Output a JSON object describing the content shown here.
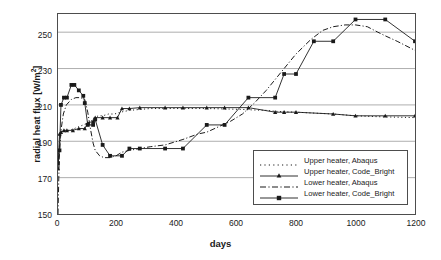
{
  "chart_data": {
    "type": "line",
    "title": "",
    "xlabel": "days",
    "ylabel": "radial heat flux [W/m²]",
    "xlim": [
      0,
      1200
    ],
    "ylim": [
      150,
      260
    ],
    "xticks": [
      0,
      200,
      400,
      600,
      800,
      1000,
      1200
    ],
    "yticks": [
      150,
      170,
      190,
      210,
      230,
      250
    ],
    "grid": "horizontal",
    "legend_position": "inside lower right",
    "series": [
      {
        "name": "Upper heater, Abaqus",
        "style": "dotted",
        "marker": "none",
        "color": "#1a1a1a",
        "x": [
          0,
          4,
          8,
          14,
          20,
          28,
          40,
          55,
          70,
          85,
          100,
          110,
          118,
          125,
          135,
          150,
          170,
          190,
          210,
          240,
          275,
          310,
          360,
          420,
          500,
          560,
          620,
          660,
          700,
          730,
          760,
          800,
          860,
          925,
          1000,
          1060,
          1100,
          1150,
          1200
        ],
        "y": [
          175,
          186,
          193,
          196,
          196,
          196,
          196,
          197,
          198,
          199,
          200,
          201,
          202,
          203,
          204,
          204,
          205,
          205,
          206,
          207,
          207.5,
          208,
          208,
          208,
          208,
          207.8,
          207.5,
          207.2,
          207,
          206.5,
          206.2,
          206,
          205.5,
          205,
          204,
          203.6,
          203.4,
          203.2,
          203
        ]
      },
      {
        "name": "Upper heater, Code_Bright",
        "style": "solid",
        "marker": "triangle",
        "color": "#1a1a1a",
        "x": [
          0,
          5,
          10,
          20,
          30,
          50,
          70,
          90,
          100,
          118,
          125,
          150,
          175,
          200,
          215,
          240,
          275,
          360,
          420,
          500,
          560,
          640,
          730,
          760,
          800,
          925,
          1000,
          1100,
          1200
        ],
        "y": [
          175,
          194,
          195,
          196,
          196,
          196,
          197,
          197,
          200,
          201,
          203,
          203,
          203,
          203,
          208,
          208,
          208.5,
          208.5,
          208.5,
          208.5,
          208.5,
          208.5,
          206,
          206,
          206,
          205,
          204,
          204,
          204
        ]
      },
      {
        "name": "Lower heater, Abaqus",
        "style": "dashdot",
        "marker": "none",
        "color": "#1a1a1a",
        "x": [
          0,
          4,
          10,
          18,
          28,
          45,
          60,
          75,
          90,
          100,
          110,
          118,
          125,
          140,
          155,
          175,
          195,
          215,
          240,
          275,
          310,
          360,
          420,
          470,
          500,
          540,
          580,
          620,
          660,
          700,
          730,
          760,
          800,
          850,
          890,
          925,
          965,
          1000,
          1040,
          1075,
          1100,
          1140,
          1200
        ],
        "y": [
          150,
          180,
          196,
          205,
          210,
          213,
          214,
          214,
          213,
          206,
          196,
          189,
          185,
          182,
          181,
          181,
          182,
          184,
          185,
          186,
          187,
          188,
          191,
          194,
          195,
          198,
          201,
          205,
          211,
          218,
          224,
          230,
          238,
          246,
          251,
          253,
          254,
          254,
          253,
          250,
          248,
          245,
          240
        ]
      },
      {
        "name": "Lower heater, Code_Bright",
        "style": "solid",
        "marker": "square",
        "color": "#1a1a1a",
        "x": [
          0,
          5,
          10,
          20,
          30,
          45,
          55,
          70,
          85,
          90,
          100,
          118,
          125,
          150,
          175,
          215,
          240,
          275,
          360,
          420,
          500,
          560,
          640,
          730,
          760,
          800,
          860,
          925,
          1000,
          1100,
          1200
        ],
        "y": [
          178,
          185,
          210,
          214,
          214,
          221,
          221,
          218,
          215,
          211,
          199,
          199,
          202,
          188,
          182,
          182,
          186,
          186,
          186,
          186,
          199,
          199,
          214,
          214,
          227,
          227,
          245,
          245,
          257,
          257,
          245
        ]
      }
    ]
  },
  "axis": {
    "y_title": "radial heat flux [W/m",
    "y_title_unit": "2",
    "y_title_close": "]",
    "x_title": "days",
    "yticks": [
      "250",
      "230",
      "210",
      "190",
      "170",
      "150"
    ],
    "xticks": [
      "0",
      "200",
      "400",
      "600",
      "800",
      "1000",
      "1200"
    ]
  },
  "legend": {
    "items": [
      {
        "label": "Upper heater, Abaqus",
        "style": "dotted"
      },
      {
        "label": "Upper heater, Code_Bright",
        "style": "solid-triangle"
      },
      {
        "label": "Lower heater, Abaqus",
        "style": "dashdot"
      },
      {
        "label": "Lower heater, Code_Bright",
        "style": "solid-square"
      }
    ]
  },
  "colors": {
    "ink": "#1a1a1a",
    "frame": "#4d4d4d",
    "grid": "#999999",
    "background": "#ffffff"
  }
}
